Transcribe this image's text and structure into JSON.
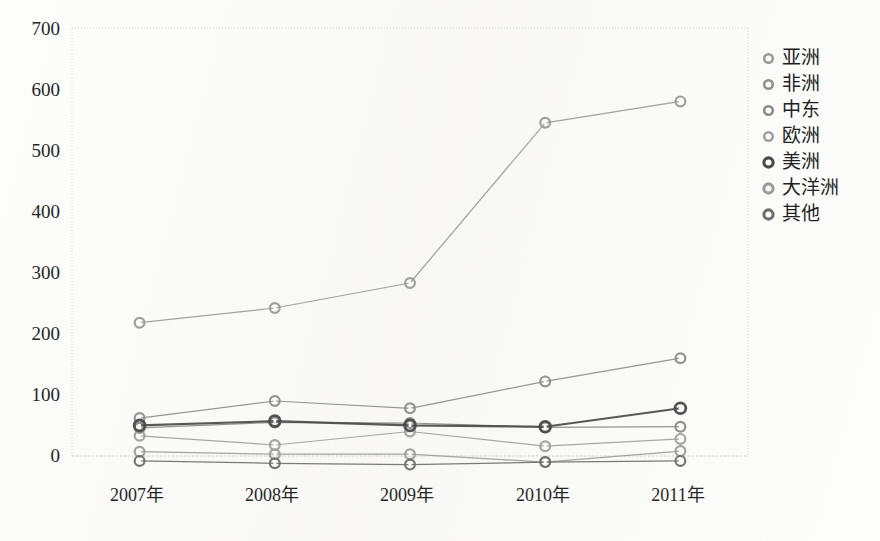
{
  "chart_data": {
    "type": "line",
    "title": "",
    "subtitle": "",
    "xlabel": "",
    "ylabel": "",
    "categories": [
      "2007年",
      "2008年",
      "2009年",
      "2010年",
      "2011年"
    ],
    "ytick_labels": [
      "700",
      "600",
      "500",
      "400",
      "300",
      "200",
      "100",
      "0"
    ],
    "ytick_values": [
      700,
      600,
      500,
      400,
      300,
      200,
      100,
      0
    ],
    "ylim": [
      -20,
      700
    ],
    "grid": false,
    "legend_position": "right",
    "series": [
      {
        "name": "亚洲",
        "color": "#9a9a9a",
        "marker": "circle-open",
        "values": [
          218,
          242,
          283,
          545,
          580
        ]
      },
      {
        "name": "非洲",
        "color": "#8e8e8e",
        "marker": "circle-open",
        "values": [
          62,
          90,
          78,
          122,
          160
        ]
      },
      {
        "name": "中东",
        "color": "#8a8a8a",
        "marker": "circle-open",
        "values": [
          46,
          55,
          54,
          47,
          48
        ]
      },
      {
        "name": "欧洲",
        "color": "#9f9f9f",
        "marker": "circle-open",
        "values": [
          33,
          18,
          40,
          16,
          28
        ]
      },
      {
        "name": "美洲",
        "color": "#4a4a4a",
        "marker": "circle-open",
        "values": [
          50,
          57,
          50,
          48,
          78
        ]
      },
      {
        "name": "大洋洲",
        "color": "#9c9c9c",
        "marker": "circle-open",
        "values": [
          7,
          3,
          3,
          -10,
          8
        ]
      },
      {
        "name": "其他",
        "color": "#6f6f6f",
        "marker": "circle-open",
        "values": [
          -8,
          -12,
          -14,
          -10,
          -8
        ]
      }
    ]
  },
  "plot": {
    "left": 72,
    "right": 748,
    "top": 28,
    "bottom": 456,
    "border_color": "#cfcfcb",
    "background": "#fdfdfc"
  },
  "legend": {
    "items": [
      {
        "label": "亚洲"
      },
      {
        "label": "非洲"
      },
      {
        "label": "中东"
      },
      {
        "label": "欧洲"
      },
      {
        "label": "美洲"
      },
      {
        "label": "大洋洲"
      },
      {
        "label": "其他"
      }
    ]
  }
}
